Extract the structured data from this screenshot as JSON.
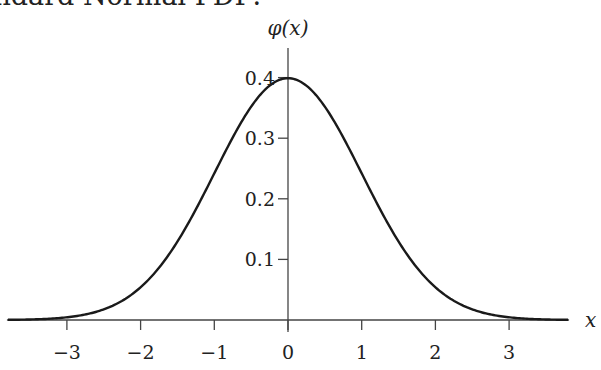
{
  "chart_data": {
    "type": "line",
    "title": "Standard Normal PDF:",
    "xlabel": "x",
    "ylabel": "φ(x)",
    "xlim": [
      -3.8,
      3.8
    ],
    "ylim": [
      0,
      0.45
    ],
    "grid": false,
    "legend": "none",
    "x_ticks": [
      -3,
      -2,
      -1,
      0,
      1,
      2,
      3
    ],
    "x_tick_labels": [
      "−3",
      "−2",
      "−1",
      "0",
      "1",
      "2",
      "3"
    ],
    "y_ticks": [
      0.1,
      0.2,
      0.3,
      0.4
    ],
    "y_tick_labels": [
      "0.1",
      "0.2",
      "0.3",
      "0.4"
    ],
    "series": [
      {
        "name": "phi",
        "function": "exp(-x^2/2)/sqrt(2*pi)",
        "x": [
          -3.8,
          -3.5,
          -3,
          -2.5,
          -2,
          -1.5,
          -1,
          -0.5,
          0,
          0.5,
          1,
          1.5,
          2,
          2.5,
          3,
          3.5,
          3.8
        ],
        "values": [
          0.0003,
          0.0009,
          0.0044,
          0.0175,
          0.054,
          0.1295,
          0.242,
          0.3521,
          0.3989,
          0.3521,
          0.242,
          0.1295,
          0.054,
          0.0175,
          0.0044,
          0.0009,
          0.0003
        ]
      }
    ]
  }
}
